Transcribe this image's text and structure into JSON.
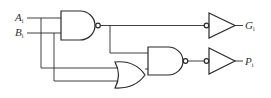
{
  "diagram": {
    "type": "logic-circuit",
    "inputs": [
      {
        "name": "A",
        "subscript": "i"
      },
      {
        "name": "B",
        "subscript": "i"
      }
    ],
    "outputs": [
      {
        "name": "G",
        "subscript": "i"
      },
      {
        "name": "P",
        "subscript": "i"
      }
    ],
    "gates": [
      {
        "id": "nand1",
        "type": "NAND",
        "inputs": [
          "A_i",
          "B_i"
        ]
      },
      {
        "id": "or1",
        "type": "OR",
        "inputs": [
          "A_i",
          "B_i"
        ]
      },
      {
        "id": "nand2",
        "type": "NAND",
        "inputs": [
          "nand1",
          "or1"
        ]
      },
      {
        "id": "buf_g",
        "type": "inverter (bubble input buffer)",
        "input": "nand1",
        "output": "G_i"
      },
      {
        "id": "buf_p",
        "type": "inverter (bubble input buffer)",
        "input": "nand2",
        "output": "P_i"
      }
    ],
    "colors": {
      "line": "#2a2a2a",
      "background": "#ffffff",
      "text": "#333333"
    }
  }
}
